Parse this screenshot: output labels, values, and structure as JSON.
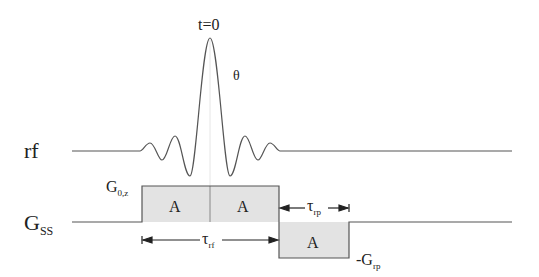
{
  "diagram": {
    "labels": {
      "t0": "t=0",
      "theta": "θ",
      "rf": "rf",
      "gss_main": "G",
      "gss_sub": "SS",
      "g0z_main": "G",
      "g0z_sub": "0,z",
      "area_a1": "A",
      "area_a2": "A",
      "area_a3": "A",
      "tau_rf_main": "τ",
      "tau_rf_sub": "rf",
      "tau_rp_main": "τ",
      "tau_rp_sub": "rp",
      "neg_grp_main": "-G",
      "neg_grp_sub": "rp"
    },
    "colors": {
      "line": "#555555",
      "lobe_fill": "#e3e3e3",
      "text": "#222222"
    }
  }
}
